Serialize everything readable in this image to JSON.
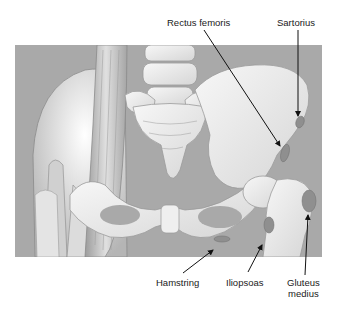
{
  "figure": {
    "background_color": "#a9a9a9",
    "bone_color": "#ececec",
    "muscle_color": "#c8c8c8",
    "attachment_color": "#8f8f8f"
  },
  "labels": {
    "rectus_femoris": "Rectus femoris",
    "sartorius": "Sartorius",
    "hamstring": "Hamstring",
    "iliopsoas": "Iliopsoas",
    "gluteus_medius_line1": "Gluteus",
    "gluteus_medius_line2": "medius"
  }
}
